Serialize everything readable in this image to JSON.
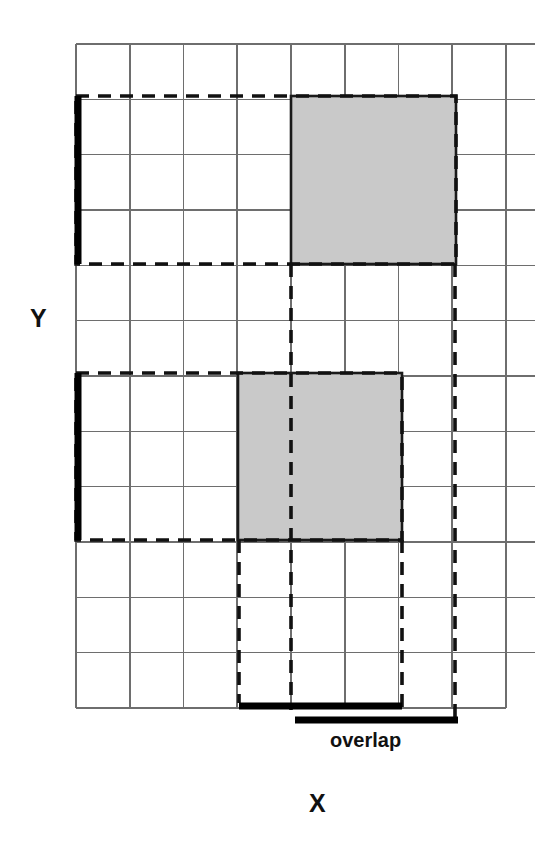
{
  "figure": {
    "title": "",
    "labels": {
      "y_axis": "Y",
      "x_axis": "X",
      "overlap": "overlap"
    },
    "colors": {
      "grid_line": "#6e6e6e",
      "shaded_box_fill": "#c9c9c9",
      "shaded_box_stroke": "#1a1a1a",
      "dashed_stroke": "#111111",
      "thick_bar": "#000000",
      "background": "#ffffff",
      "text": "#111111"
    }
  },
  "chart_data": {
    "type": "diagram",
    "xlabel": "X",
    "ylabel": "Y",
    "grid": {
      "columns": 8,
      "rows": 12,
      "x0": 76,
      "y0": 44,
      "cell_width": 53.75,
      "cell_height": 55.33,
      "right_overhang": 29,
      "show": true
    },
    "boxes": [
      {
        "name": "upper-shaded-box",
        "fill": "#c9c9c9",
        "col_start": 4,
        "col_end": 7,
        "row_start": 1,
        "row_end": 4,
        "x": 291,
        "y": 96,
        "width": 165,
        "height": 168
      },
      {
        "name": "lower-shaded-box",
        "fill": "#c9c9c9",
        "col_start": 3,
        "col_end": 6,
        "row_start": 6,
        "row_end": 9,
        "x": 238,
        "y": 373,
        "width": 164,
        "height": 167
      }
    ],
    "dashed_regions": [
      {
        "name": "upper-extent-outline",
        "x": 76,
        "y": 96,
        "width": 380,
        "height": 168
      },
      {
        "name": "lower-extent-outline",
        "x": 76,
        "y": 373,
        "width": 326,
        "height": 167
      }
    ],
    "dashed_projection_lines": [
      {
        "name": "upper-left-projection",
        "x": 291,
        "y_start": 264,
        "y_end": 710
      },
      {
        "name": "upper-right-projection",
        "x": 455,
        "y_start": 264,
        "y_end": 724
      },
      {
        "name": "lower-left-projection",
        "x": 239,
        "y_start": 540,
        "y_end": 703
      },
      {
        "name": "lower-right-projection",
        "x": 402,
        "y_start": 540,
        "y_end": 710
      }
    ],
    "thick_y_extent_bars": [
      {
        "name": "upper-y-extent-bar",
        "x": 78,
        "y_start": 96,
        "y_end": 264
      },
      {
        "name": "lower-y-extent-bar",
        "x": 78,
        "y_start": 373,
        "y_end": 540
      }
    ],
    "thick_x_extent_bars": [
      {
        "name": "lower-x-extent-bar",
        "y": 706,
        "x_start": 239,
        "x_end": 402
      },
      {
        "name": "upper-x-extent-bar",
        "y": 720,
        "x_start": 295,
        "x_end": 458
      }
    ],
    "annotations": [
      {
        "text": "overlap",
        "x": 385,
        "y": 745
      },
      {
        "text": "Y",
        "x": 38,
        "y": 318
      },
      {
        "text": "X",
        "x": 317,
        "y": 803
      }
    ]
  }
}
